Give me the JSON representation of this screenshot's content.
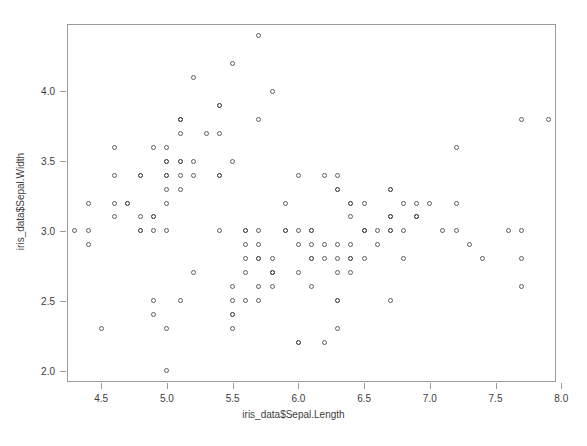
{
  "chart_data": {
    "type": "scatter",
    "title": "",
    "xlabel": "iris_data$Sepal.Length",
    "ylabel": "iris_data$Sepal.Width",
    "xlim": [
      4.24,
      7.96
    ],
    "ylim": [
      1.92,
      4.48
    ],
    "xticks": [
      4.5,
      5.0,
      5.5,
      6.0,
      6.5,
      7.0,
      7.5,
      8.0
    ],
    "xtick_labels": [
      "4.5",
      "5.0",
      "5.5",
      "6.0",
      "6.5",
      "7.0",
      "7.5",
      "8.0"
    ],
    "yticks": [
      2.0,
      2.5,
      3.0,
      3.5,
      4.0
    ],
    "ytick_labels": [
      "2.0",
      "2.5",
      "3.0",
      "3.5",
      "4.0"
    ],
    "grid": false,
    "legend": null,
    "marker": "open-circle",
    "marker_color": "#5c5c5c",
    "marker_size": 5,
    "n_points": 150,
    "x": [
      5.1,
      4.9,
      4.7,
      4.6,
      5.0,
      5.4,
      4.6,
      5.0,
      4.4,
      4.9,
      5.4,
      4.8,
      4.8,
      4.3,
      5.8,
      5.7,
      5.4,
      5.1,
      5.7,
      5.1,
      5.4,
      5.1,
      4.6,
      5.1,
      4.8,
      5.0,
      5.0,
      5.2,
      5.2,
      4.7,
      4.8,
      5.4,
      5.2,
      5.5,
      4.9,
      5.0,
      5.5,
      4.9,
      4.4,
      5.1,
      5.0,
      4.5,
      4.4,
      5.0,
      5.1,
      4.8,
      5.1,
      4.6,
      5.3,
      5.0,
      7.0,
      6.4,
      6.9,
      5.5,
      6.5,
      5.7,
      6.3,
      4.9,
      6.6,
      5.2,
      5.0,
      5.9,
      6.0,
      6.1,
      5.6,
      6.7,
      5.6,
      5.8,
      6.2,
      5.6,
      5.9,
      6.1,
      6.3,
      6.1,
      6.4,
      6.6,
      6.8,
      6.7,
      6.0,
      5.7,
      5.5,
      5.5,
      5.8,
      6.0,
      5.4,
      6.0,
      6.7,
      6.3,
      5.6,
      5.5,
      5.5,
      6.1,
      5.8,
      5.0,
      5.6,
      5.7,
      5.7,
      6.2,
      5.1,
      5.7,
      6.3,
      5.8,
      7.1,
      6.3,
      6.5,
      7.6,
      4.9,
      7.3,
      6.7,
      7.2,
      6.5,
      6.4,
      6.8,
      5.7,
      5.8,
      6.4,
      6.5,
      7.7,
      7.7,
      6.0,
      6.9,
      5.6,
      7.7,
      6.3,
      6.7,
      7.2,
      6.2,
      6.1,
      6.4,
      7.2,
      7.4,
      7.9,
      6.4,
      6.3,
      6.1,
      7.7,
      6.3,
      6.4,
      6.0,
      6.9,
      6.7,
      6.9,
      5.8,
      6.8,
      6.7,
      6.7,
      6.3,
      6.5,
      6.2,
      5.9
    ],
    "y": [
      3.5,
      3.0,
      3.2,
      3.1,
      3.6,
      3.9,
      3.4,
      3.4,
      2.9,
      3.1,
      3.7,
      3.4,
      3.0,
      3.0,
      4.0,
      4.4,
      3.9,
      3.5,
      3.8,
      3.8,
      3.4,
      3.7,
      3.6,
      3.3,
      3.4,
      3.0,
      3.4,
      3.5,
      3.4,
      3.2,
      3.1,
      3.4,
      4.1,
      4.2,
      3.1,
      3.2,
      3.5,
      3.6,
      3.0,
      3.4,
      3.5,
      2.3,
      3.2,
      3.5,
      3.8,
      3.0,
      3.8,
      3.2,
      3.7,
      3.3,
      3.2,
      3.2,
      3.1,
      2.3,
      2.8,
      2.8,
      3.3,
      2.4,
      2.9,
      2.7,
      2.0,
      3.0,
      2.2,
      2.9,
      2.9,
      3.1,
      3.0,
      2.7,
      2.2,
      2.5,
      3.2,
      2.8,
      2.5,
      2.8,
      2.9,
      3.0,
      2.8,
      3.0,
      2.9,
      2.6,
      2.4,
      2.4,
      2.7,
      2.7,
      3.0,
      3.4,
      3.1,
      2.3,
      3.0,
      2.5,
      2.6,
      3.0,
      2.6,
      2.3,
      2.7,
      3.0,
      2.9,
      2.9,
      2.5,
      2.8,
      3.3,
      2.7,
      3.0,
      2.9,
      3.0,
      3.0,
      2.5,
      2.9,
      2.5,
      3.6,
      3.2,
      2.7,
      3.0,
      2.5,
      2.8,
      3.2,
      3.0,
      3.8,
      2.6,
      2.2,
      3.2,
      2.8,
      2.8,
      2.7,
      3.3,
      3.2,
      2.8,
      3.0,
      2.8,
      3.0,
      2.8,
      3.8,
      2.8,
      2.8,
      2.6,
      3.0,
      3.4,
      3.1,
      3.0,
      3.1,
      3.1,
      3.1,
      2.7,
      3.2,
      3.3,
      3.0,
      2.5,
      3.0,
      3.4,
      3.0
    ]
  }
}
